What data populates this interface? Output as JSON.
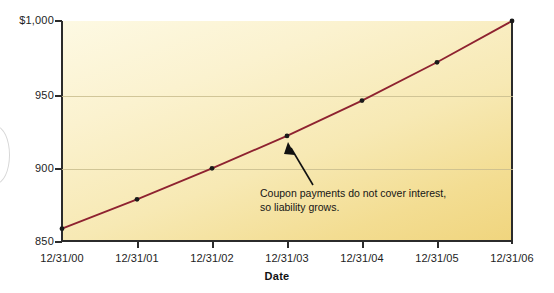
{
  "chart_data": {
    "type": "line",
    "title": "",
    "xlabel": "Date",
    "ylabel": "",
    "categories": [
      "12/31/00",
      "12/31/01",
      "12/31/02",
      "12/31/03",
      "12/31/04",
      "12/31/05",
      "12/31/06"
    ],
    "series": [
      {
        "name": "Carrying value of liability",
        "values": [
          859,
          879,
          900,
          922,
          946,
          972,
          1000
        ],
        "color": "#8e2230",
        "marker": "circle",
        "marker_color": "#1a1a1a"
      }
    ],
    "ylim": [
      850,
      1000
    ],
    "yticks": [
      850,
      900,
      950,
      1000
    ],
    "ytick_labels": [
      "850",
      "900",
      "950",
      "$1,000"
    ],
    "grid": true,
    "gridlines_at": [
      900,
      950
    ],
    "legend": "none",
    "annotations": [
      {
        "text_line1": "Coupon payments do not cover interest,",
        "text_line2": "so liability grows.",
        "points_to_category": "12/31/03",
        "points_to_value": 922,
        "arrow": true
      }
    ],
    "plot_background": "cream-to-gold gradient",
    "colors": {
      "line": "#8e2230",
      "axis": "#2b2b2b",
      "gridline": "#c9bd8e",
      "plot_fill_light": "#fdf9e3",
      "plot_fill_dark": "#f0d57e",
      "text": "#1d1d1d",
      "page_background": "#ffffff"
    }
  }
}
